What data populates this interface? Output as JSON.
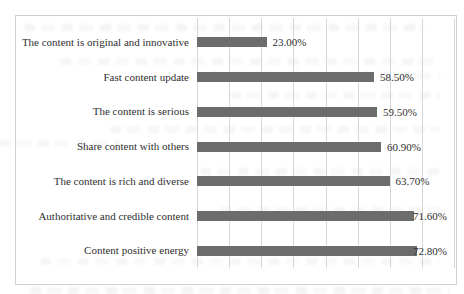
{
  "page": {
    "background": "#ffffff",
    "frame_border_color": "#d0d0d0"
  },
  "chart_data": {
    "type": "bar",
    "orientation": "horizontal",
    "title": "",
    "xlabel": "",
    "ylabel": "",
    "categories": [
      "The content is original and innovative",
      "Fast content update",
      "The content is serious",
      "Share content with others",
      "The content is rich and diverse",
      "Authoritative and credible content",
      "Content positive energy"
    ],
    "values": [
      23.0,
      58.5,
      59.5,
      60.9,
      63.7,
      71.6,
      72.8
    ],
    "data_labels": [
      "23.00%",
      "58.50%",
      "59.50%",
      "60.90%",
      "63.70%",
      "71.60%",
      "72.80%"
    ],
    "xlim": [
      0,
      85
    ],
    "grid": true,
    "gridline_count": 9,
    "legend": "none",
    "bar_color": "#6c6c6c",
    "gridline_color": "#d7d7d7",
    "text_color": "#2f2f2f"
  }
}
